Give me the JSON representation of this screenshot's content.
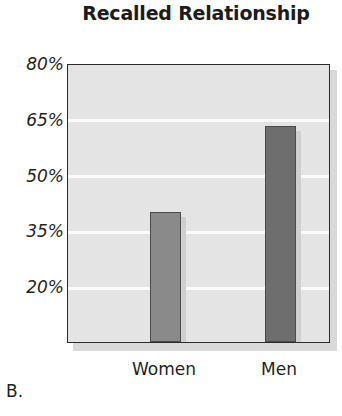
{
  "panel": {
    "letter": "B."
  },
  "chart_data": {
    "type": "bar",
    "title": "Recalled Relationship",
    "xlabel": "",
    "ylabel": "",
    "categories": [
      "Women",
      "Men"
    ],
    "values": [
      40,
      63
    ],
    "series": [
      {
        "name": "Recalled Relationship",
        "values": [
          40,
          63
        ]
      }
    ],
    "ylim": [
      5,
      80
    ],
    "yticks": [
      20,
      35,
      50,
      65,
      80
    ],
    "ytick_labels": [
      "20%",
      "35%",
      "50%",
      "65%",
      "80%"
    ],
    "grid": true,
    "grid_orientation": "horizontal",
    "legend": "none",
    "bar_colors": [
      "#8a8a8a",
      "#6e6e6e"
    ],
    "plot_background": "#e4e4e4",
    "gridline_color": "#fbfbfb",
    "frame_color": "#2b2b2b",
    "annotations": []
  }
}
